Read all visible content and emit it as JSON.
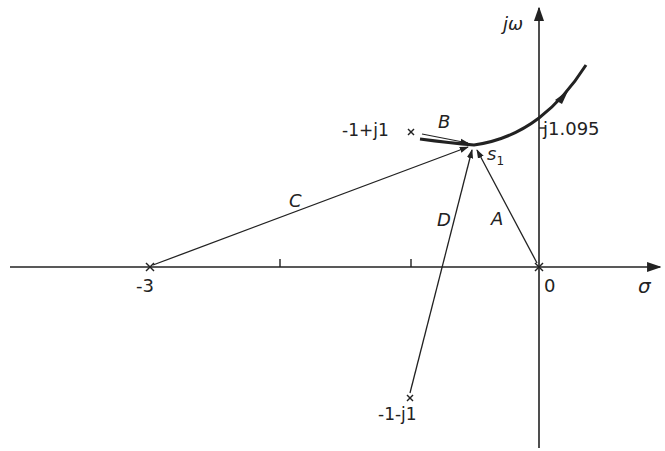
{
  "colors": {
    "ink": "#222222",
    "background": "#ffffff"
  },
  "axes": {
    "real_label": "σ",
    "imag_label": "jω",
    "origin_label": "0",
    "tick_label_minus3": "-3",
    "imag_crossing_label": "j1.095"
  },
  "poles": [
    {
      "label": "-1+j1",
      "re": -1,
      "im": 1
    },
    {
      "label": "-1-j1",
      "re": -1,
      "im": -1
    },
    {
      "label": "-3",
      "re": -3,
      "im": 0
    },
    {
      "label": "0",
      "re": 0,
      "im": 0
    }
  ],
  "test_point": {
    "label": "s",
    "subscript": "1"
  },
  "vectors": [
    {
      "name": "A",
      "from": "0"
    },
    {
      "name": "B",
      "from": "-1+j1"
    },
    {
      "name": "C",
      "from": "-3"
    },
    {
      "name": "D",
      "from": "-1-j1"
    }
  ]
}
